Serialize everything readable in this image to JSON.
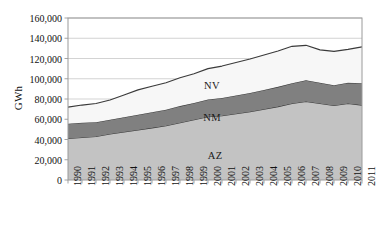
{
  "chart_data": {
    "type": "area",
    "stacked": true,
    "title": "",
    "xlabel": "",
    "ylabel": "GWh",
    "ylim": [
      0,
      160000
    ],
    "ytick_values": [
      0,
      20000,
      40000,
      60000,
      80000,
      100000,
      120000,
      140000,
      160000
    ],
    "ytick_labels": [
      "0",
      "20,000",
      "40,000",
      "60,000",
      "80,000",
      "100,000",
      "120,000",
      "140,000",
      "160,000"
    ],
    "grid": true,
    "grid_axis": "y",
    "legend": "inline-area-labels",
    "categories": [
      1990,
      1991,
      1992,
      1993,
      1994,
      1995,
      1996,
      1997,
      1998,
      1999,
      2000,
      2001,
      2002,
      2003,
      2004,
      2005,
      2006,
      2007,
      2008,
      2009,
      2010,
      2011
    ],
    "xtick_labels": [
      "1990",
      "1991",
      "1992",
      "1993",
      "1994",
      "1995",
      "1996",
      "1997",
      "1998",
      "1999",
      "2000",
      "2001",
      "2002",
      "2003",
      "2004",
      "2005",
      "2006",
      "2007",
      "2008",
      "2009",
      "2010",
      "2011"
    ],
    "series": [
      {
        "name": "AZ",
        "label": "AZ",
        "color": "#c3c3c3",
        "values": [
          41000,
          42000,
          43000,
          45500,
          47500,
          49500,
          51500,
          53500,
          56500,
          59500,
          62500,
          63500,
          65500,
          67500,
          70000,
          72500,
          75500,
          77500,
          75500,
          73500,
          75500,
          74000
        ]
      },
      {
        "name": "NM",
        "label": "NM",
        "color": "#808080",
        "values": [
          14500,
          14500,
          14000,
          14000,
          14500,
          15000,
          15500,
          16000,
          16500,
          16500,
          17000,
          17500,
          18000,
          18500,
          19000,
          19500,
          20000,
          21000,
          20500,
          20000,
          20500,
          21500
        ]
      },
      {
        "name": "NV",
        "label": "NV",
        "color": "#f7f7f7",
        "values": [
          16500,
          17500,
          18500,
          19500,
          22000,
          24500,
          25500,
          26500,
          28000,
          29000,
          30500,
          31500,
          32500,
          33500,
          34500,
          35500,
          36500,
          34500,
          32500,
          33500,
          33000,
          36000
        ]
      }
    ],
    "series_label_positions": [
      {
        "name": "NV",
        "x_pct": 0.558,
        "y_pct": 0.371
      },
      {
        "name": "NM",
        "x_pct": 0.558,
        "y_pct": 0.511
      },
      {
        "name": "AZ",
        "x_pct": 0.566,
        "y_pct": 0.677
      }
    ],
    "totals": [
      72000,
      74000,
      75500,
      79000,
      84000,
      89000,
      92500,
      96000,
      101000,
      105000,
      110000,
      112500,
      116000,
      119500,
      123500,
      127500,
      132000,
      133000,
      128500,
      127000,
      129000,
      131500
    ]
  },
  "axes": {
    "plot_left_px": 68,
    "plot_right_px": 362,
    "plot_top_px": 18,
    "plot_bottom_px": 180,
    "frame_color": "#9a9a9a",
    "grid_color": "#c8c8c8",
    "outline_color": "#3a3a3a"
  }
}
